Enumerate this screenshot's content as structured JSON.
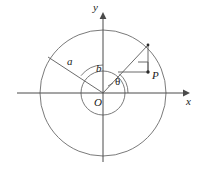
{
  "figure": {
    "type": "geometry-diagram",
    "background_color": "#ffffff",
    "stroke_color": "#555555",
    "axis_color": "#4a4a4a",
    "label_color": "#1a1a1a",
    "labels": {
      "y_axis": "y",
      "x_axis": "x",
      "origin": "O",
      "outer_radius": "a",
      "inner_angle": "b",
      "theta_angle": "θ",
      "point": "P"
    },
    "geometry": {
      "center": {
        "x": 103,
        "y": 93
      },
      "outer_circle_radius": 63,
      "inner_circle_radius": 22,
      "x_axis": {
        "x1": 17,
        "y1": 93,
        "x2": 186,
        "y2": 93
      },
      "y_axis": {
        "x1": 103,
        "y1": 162,
        "x2": 103,
        "y2": 16
      },
      "radius_a_endpoint": {
        "x": 48,
        "y": 57
      },
      "terminal_point_on_outer_circle": {
        "x": 148,
        "y": 45
      },
      "point_P": {
        "x": 148,
        "y": 72
      },
      "right_angle_marker": {
        "x": 138,
        "y": 62,
        "size": 10
      }
    }
  }
}
